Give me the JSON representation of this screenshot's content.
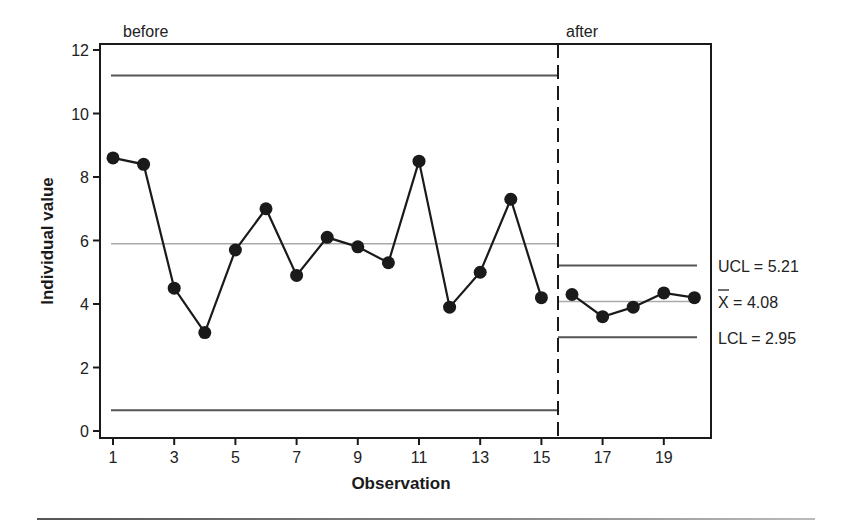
{
  "chart_data": {
    "type": "line",
    "title": "",
    "xlabel": "Observation",
    "ylabel": "Individual value",
    "xlim": [
      0.6,
      20.5
    ],
    "ylim": [
      0,
      12
    ],
    "x_ticks": [
      1,
      3,
      5,
      7,
      9,
      11,
      13,
      15,
      17,
      19
    ],
    "y_ticks": [
      0,
      2,
      4,
      6,
      8,
      10,
      12
    ],
    "grid": false,
    "phases": [
      {
        "name": "before",
        "observations": [
          1,
          2,
          3,
          4,
          5,
          6,
          7,
          8,
          9,
          10,
          11,
          12,
          13,
          14,
          15
        ],
        "values": [
          8.6,
          8.4,
          4.5,
          3.1,
          5.7,
          7.0,
          4.9,
          6.1,
          5.8,
          5.3,
          8.5,
          3.9,
          5.0,
          7.3,
          4.2
        ],
        "ucl": 11.2,
        "center": 5.9,
        "lcl": 0.65
      },
      {
        "name": "after",
        "observations": [
          16,
          17,
          18,
          19,
          20
        ],
        "values": [
          4.3,
          3.6,
          3.9,
          4.35,
          4.2
        ],
        "ucl": 5.21,
        "center": 4.08,
        "lcl": 2.95
      }
    ],
    "phase_divider_x": 15.55,
    "annotations": [
      "UCL = 5.21",
      "X̄ = 4.08",
      "LCL = 2.95"
    ]
  },
  "labels": {
    "before": "before",
    "after": "after",
    "ucl": "UCL = 5.21",
    "xbar_symbol": "X",
    "xbar_rest": " = 4.08",
    "lcl": "LCL = 2.95",
    "xlabel": "Observation",
    "ylabel": "Individual value"
  }
}
